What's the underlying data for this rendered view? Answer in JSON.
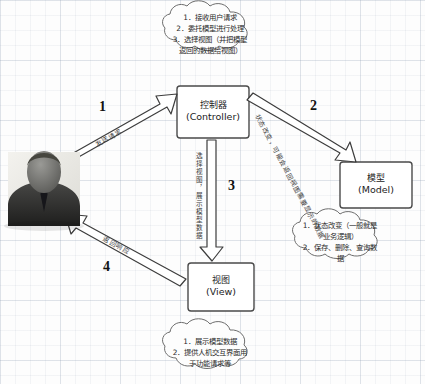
{
  "diagram": {
    "background": "graph-paper",
    "boxes": {
      "controller": {
        "cn": "控制器",
        "en": "(Controller)"
      },
      "model": {
        "cn": "模型",
        "en": "(Model)"
      },
      "view": {
        "cn": "视图",
        "en": "(View)"
      }
    },
    "clouds": {
      "controller_notes": {
        "lines": [
          "1．接收用户请求",
          "2．委托模型进行处理",
          "3．选择视图（并把模型",
          "返回的数据给视图）"
        ]
      },
      "model_notes": {
        "lines": [
          "1．状态改变（一般就是",
          "业务逻辑）",
          "2．保存、删除、查询数",
          "据"
        ]
      },
      "view_notes": {
        "lines": [
          "1．展示模型数据",
          "2．提供人机交互界面用",
          "于功能请求等"
        ]
      }
    },
    "arrows": [
      {
        "number": "1",
        "label": "发送请求",
        "from": "user",
        "to": "controller"
      },
      {
        "number": "2",
        "label": "状态改变，可能会返回视图需要显示的数据",
        "from": "controller",
        "to": "model"
      },
      {
        "number": "3",
        "label": "选择视图，展示模型数据",
        "from": "controller",
        "to": "view"
      },
      {
        "number": "4",
        "label": "返回响应",
        "from": "view",
        "to": "user"
      }
    ],
    "actor": {
      "name": "用户",
      "icon": "user-avatar-icon"
    },
    "colors": {
      "stroke": "#4a4a4a",
      "box_fill": "#ffffff",
      "cloud_fill": "#fdfdfd",
      "text": "#1c1c1c",
      "grid": "#96a5b9"
    }
  }
}
